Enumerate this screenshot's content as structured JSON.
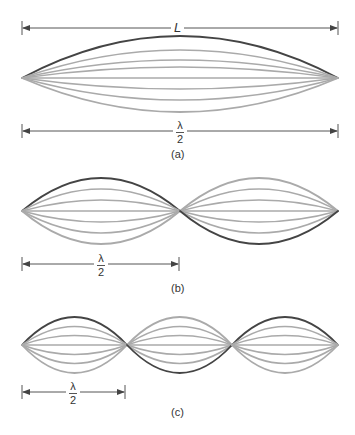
{
  "figure": {
    "colors": {
      "highlight": "#444444",
      "normal": "#aaaaaa",
      "dimension": "#555555"
    },
    "panels": [
      {
        "id": "a",
        "caption": "(a)",
        "dimension_labels": {
          "top": "L",
          "bottom_numerator": "λ",
          "bottom_denominator": "2"
        },
        "loops": 1,
        "description": "Fundamental standing wave on a string of length L; L = λ/2"
      },
      {
        "id": "b",
        "caption": "(b)",
        "dimension_labels": {
          "bottom_numerator": "λ",
          "bottom_denominator": "2"
        },
        "loops": 2,
        "description": "Second harmonic: two loops, each λ/2 long"
      },
      {
        "id": "c",
        "caption": "(c)",
        "dimension_labels": {
          "bottom_numerator": "λ",
          "bottom_denominator": "2"
        },
        "loops": 3,
        "description": "Third harmonic: three loops, each λ/2 long"
      }
    ]
  }
}
